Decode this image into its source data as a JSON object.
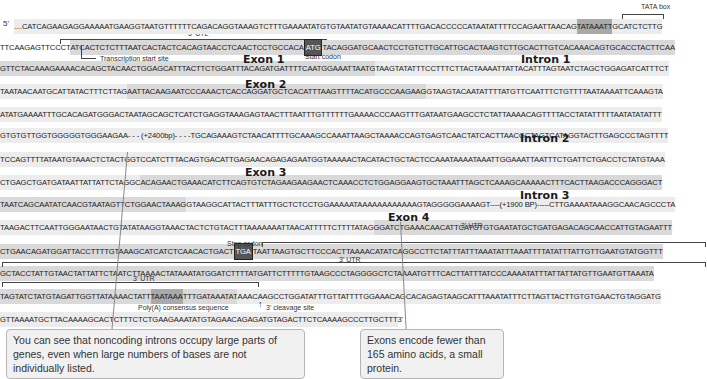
{
  "labels": {
    "five_prime": "5'",
    "three_prime": "3'",
    "tata_box": "TATA box",
    "utl_5": "5' UTL",
    "transcription_start": "Transcription start site",
    "start_codon": "Start codon",
    "stop_codon": "Stop codon",
    "utr_3": "3' UTR",
    "polyA": "Poly(A) consensus sequence",
    "cleavage": "3' cleavage site"
  },
  "regions": {
    "exon1": "Exon 1",
    "exon2": "Exon 2",
    "exon3": "Exon 3",
    "exon4": "Exon 4",
    "intron1": "Intron 1",
    "intron2": "Intron 2",
    "intron3": "Intron 3"
  },
  "rows": [
    {
      "segments": [
        {
          "text": "....CATCAGAAGAGGAAAAATGAAGGTAATGTTTTTTCAGACAGGTAAAGTCTTTGAAAATATGTGTAATATGTAAAACATTTTGACACCCCCATAATATTTTCCAGAATTAACAG",
          "shade": "light"
        },
        {
          "text": "TATAAATT",
          "shade": "tata"
        },
        {
          "text": "GCATCTCTTG",
          "shade": "light"
        }
      ]
    },
    {
      "segments": [
        {
          "text": "TTCAAGAGTTCCCT",
          "shade": "none"
        },
        {
          "text": "ATCACTCTCTTTAATCACTACTCACAGTAACCTCAACTCCTGCCACA",
          "shade": "mid"
        },
        {
          "text": "ATG",
          "shade": "boxed"
        },
        {
          "text": "TACAGGATGCAACTCCTGTCTTGCATTGCACTAAGTCTTGCACTTGTCACAAACAGTGCACCTACTTCAA",
          "shade": "mid"
        }
      ]
    },
    {
      "segments": [
        {
          "text": "GTTCTACAAAGAAAACACAGCTACAACTGGAGCATTTACTTCTGGATTTACAGATGATTTTCAATGGAAATTAATG",
          "shade": "mid"
        },
        {
          "text": "TAAGTATATTTCCTTTCTTACTAAAATTATTACATTTAGTAATCTAGCTGGAGATCATTTCT",
          "shade": "light"
        }
      ]
    },
    {
      "segments": [
        {
          "text": "TAATAACAATGCATTATACTTTCTTAG",
          "shade": "light"
        },
        {
          "text": "AATTACAAGAATCCCAAACTCACCAGGATGCTCACATTTAAGTTTTACATGCCCAAGAAG",
          "shade": "mid"
        },
        {
          "text": "GTAAGTACAATATTTTATGTTCAATTTCTGTTTTAATAAAATTCAAAGTA",
          "shade": "light"
        }
      ]
    },
    {
      "segments": [
        {
          "text": "ATATGAAAATTTGCACAGATGGGACTAATAGCAGCTCATCTGAGGTAAAGAGTAACTTTAATTTGTTTTTTGAAAACCCAAGTTTGATAATGAAGCCTCTATTAAAACAGTTTTACCTATATTTTTAATATATATTT",
          "shade": "light"
        }
      ]
    },
    {
      "segments": [
        {
          "text": "GTGTGTTGGTGGGGGTGGGAAGAA- - - (+2400bp)- - - -TGCAGAAAGTCTAACATTTTGCAAAGCCAAATTAAGCTAAAACCAGTGAGTCAACTATCACTTAACGCTAGTCATAGGTACTTGAGCCCTAGTTTT",
          "shade": "light"
        }
      ]
    },
    {
      "segments": [
        {
          "text": "TCCAGTTTTATAATGTAAACTCTACTGGTCCATCTTTACAGTGACATTGAGAACAGAGAGAATGGTAAAAACTACATACTGCTACTCCAAATAAAATAAATTGGAAATTAATTTCTGATTCTGACCTCTATGTAAA",
          "shade": "light"
        }
      ]
    },
    {
      "segments": [
        {
          "text": "CTGAGCTGATGATAATTATTATTCTAGGC",
          "shade": "light"
        },
        {
          "text": "ACAGAACTGAAACATCTTCAGTGTCTAGAAGAAGAACTCAAACCTCTGGAGGAAGTGCTAAATTTAGCTCAAAGCAAAAACTTTCACTTAAGACCCAGGGACT",
          "shade": "mid"
        }
      ]
    },
    {
      "segments": [
        {
          "text": "TAATCAGCAATATCAACGTAATAGTTCTGGAACTAAAG",
          "shade": "mid"
        },
        {
          "text": "GTAAGGCATTACTTTATTTGCTCTCCTGGAAAAATAAAAAAAAAAAAGTAGGGGGAAAAGT----(+1900 BP)-----CTTGAAAATAAAGGCAACAGCCCTA",
          "shade": "light"
        }
      ]
    },
    {
      "segments": [
        {
          "text": "TAAGACTTCAATTGGGAATAACTGTATATAAGGTAAACTACTCTGTACTTTAAAAAAATTAACATTTTTCTTTTATAG",
          "shade": "light"
        },
        {
          "text": "GGATCTGAAACAACATTCATGTGTGAATATGCTGATGAGACAGCAACCATTGTAGAATTT",
          "shade": "mid"
        }
      ]
    },
    {
      "segments": [
        {
          "text": "CTGAACAGATGGATTACCTTTTGTAAAGCATCATCTCAACACTGACT",
          "shade": "mid"
        },
        {
          "text": "TGA",
          "shade": "boxed"
        },
        {
          "text": "TAATTAAGTGCTTCCCACTTAAAACATATCAGGCCTTCTATTTATTTAAATATTTAAATTTTATATTTATTGTTGAATGTATGGTTT",
          "shade": "mid"
        }
      ]
    },
    {
      "segments": [
        {
          "text": "GCTACCTATTGTAACTATTATTCTAATCTTAAAACTATAAATATGGATCTTTTATGATTCTTTTTGTAAGCCCTAGGGGCTCTAAAATGTTTCACTTATTTATCCCAAAATATTTATTATTATGTTGAATGTTAAATA",
          "shade": "mid"
        }
      ]
    },
    {
      "segments": [
        {
          "text": "TAGTATCTATGTAGATTGGTTATAAAACTATT",
          "shade": "mid"
        },
        {
          "text": "TAATAAA",
          "shade": "tata"
        },
        {
          "text": "TTTGATAAATAT",
          "shade": "mid"
        },
        {
          "text": "AAACAAGCCTGGATATTTGTTATTTTGGAAACAGCACAGAGTAAGCATTTAAATATTTCTTAGTTACTTGTGTGAACTGTAGGATG",
          "shade": "light"
        }
      ]
    },
    {
      "segments": [
        {
          "text": "GTTAAAATGCTTACAAAAGCACTCTTTCTCTGAAGAAATATGTAGAACAGAGATGTAGACTTCTCAAAAGCCCTTGCTTT",
          "shade": "light"
        },
        {
          "text": " 3'",
          "shade": "none"
        }
      ]
    }
  ],
  "notes": {
    "introns": "You can see that noncoding introns occupy large parts of genes, even when large numbers of bases are not individually listed.",
    "exons": "Exons encode fewer than 165 amino acids, a small protein."
  }
}
